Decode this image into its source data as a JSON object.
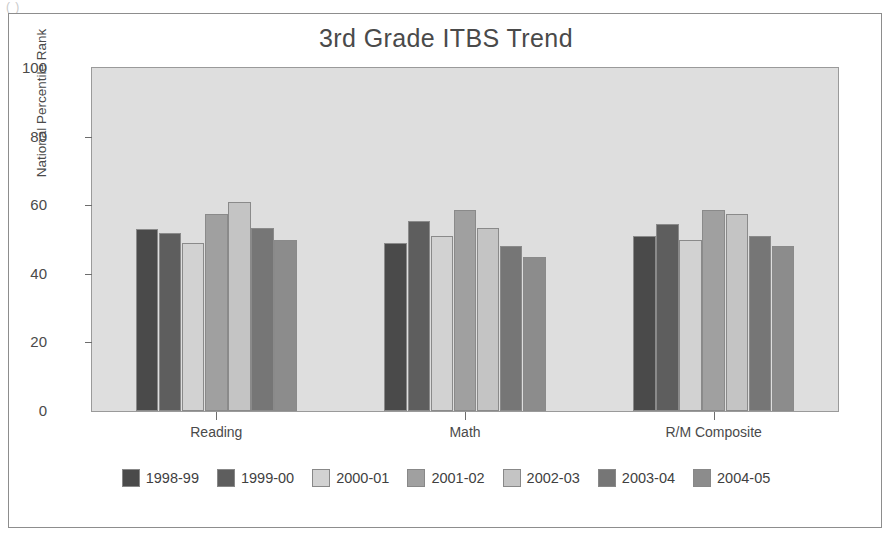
{
  "scan_artifact": "(  )",
  "chart_data": {
    "type": "bar",
    "title": "3rd Grade ITBS Trend",
    "xlabel": "",
    "ylabel": "National Percentile Rank",
    "ylim": [
      0,
      100
    ],
    "yticks": [
      0,
      20,
      40,
      60,
      80,
      100
    ],
    "grid": false,
    "legend_position": "bottom",
    "categories": [
      "Reading",
      "Math",
      "R/M Composite"
    ],
    "series": [
      {
        "name": "1998-99",
        "color": "#4a4a4a",
        "values": [
          53,
          49,
          51
        ]
      },
      {
        "name": "1999-00",
        "color": "#5e5e5e",
        "values": [
          52,
          55.5,
          54.5
        ]
      },
      {
        "name": "2000-01",
        "color": "#d2d2d2",
        "values": [
          49,
          51,
          50
        ]
      },
      {
        "name": "2001-02",
        "color": "#a0a0a0",
        "values": [
          57.5,
          58.5,
          58.5
        ]
      },
      {
        "name": "2002-03",
        "color": "#c4c4c4",
        "values": [
          61,
          53.5,
          57.5
        ]
      },
      {
        "name": "2003-04",
        "color": "#767676",
        "values": [
          53.5,
          48,
          51
        ]
      },
      {
        "name": "2004-05",
        "color": "#8c8c8c",
        "values": [
          50,
          45,
          48
        ]
      }
    ]
  }
}
